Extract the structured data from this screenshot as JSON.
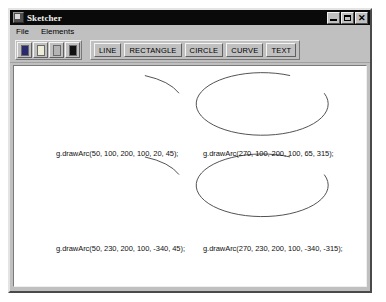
{
  "window": {
    "title": "Sketcher",
    "icon": "app-icon",
    "controls": [
      {
        "name": "minimize",
        "label": "_"
      },
      {
        "name": "maximize",
        "label": "□"
      },
      {
        "name": "close",
        "label": "✕"
      }
    ]
  },
  "menubar": {
    "items": [
      {
        "label": "File"
      },
      {
        "label": "Elements"
      }
    ]
  },
  "toolbar": {
    "colors": [
      {
        "name": "color-blue",
        "hex": "#2a2a6e"
      },
      {
        "name": "color-yellow",
        "hex": "#ededd8"
      },
      {
        "name": "color-gray",
        "hex": "#b4b4b4"
      },
      {
        "name": "color-black",
        "hex": "#111111"
      }
    ],
    "shapes": [
      {
        "label": "LINE"
      },
      {
        "label": "RECTANGLE"
      },
      {
        "label": "CIRCLE"
      },
      {
        "label": "CURVE"
      },
      {
        "label": "TEXT"
      }
    ]
  },
  "canvas": {
    "arcs": [
      {
        "name": "arc-top-left",
        "caption": "g.drawArc(50, 100, 200, 100, 20, 45);",
        "x": 50,
        "y": 100,
        "width": 200,
        "height": 100,
        "start_angle": 20,
        "arc_angle": 45
      },
      {
        "name": "arc-top-right",
        "caption": "g.drawArc(270, 100, 200, 100, 65, 315);",
        "x": 270,
        "y": 100,
        "width": 200,
        "height": 100,
        "start_angle": 65,
        "arc_angle": 315
      },
      {
        "name": "arc-bottom-left",
        "caption": "g.drawArc(50, 230, 200, 100, -340, 45);",
        "x": 50,
        "y": 230,
        "width": 200,
        "height": 100,
        "start_angle": -340,
        "arc_angle": 45
      },
      {
        "name": "arc-bottom-right",
        "caption": "g.drawArc(270, 230, 200, 100, -340, -315);",
        "x": 270,
        "y": 230,
        "width": 200,
        "height": 100,
        "start_angle": -340,
        "arc_angle": -315
      }
    ]
  }
}
